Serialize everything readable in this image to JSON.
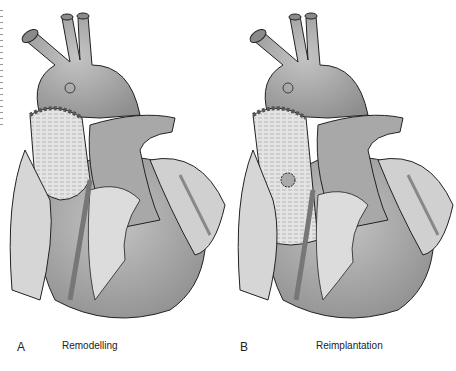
{
  "figure": {
    "panels": [
      {
        "letter": "A",
        "label": "Remodelling"
      },
      {
        "letter": "B",
        "label": "Reimplantation"
      }
    ]
  },
  "colors": {
    "background": "#ffffff",
    "vessel": "#9a9a9a",
    "vessel_light": "#bdbdbd",
    "graft": "#e2e2e2",
    "tissue": "#cfcfcf",
    "outline": "#222222"
  }
}
